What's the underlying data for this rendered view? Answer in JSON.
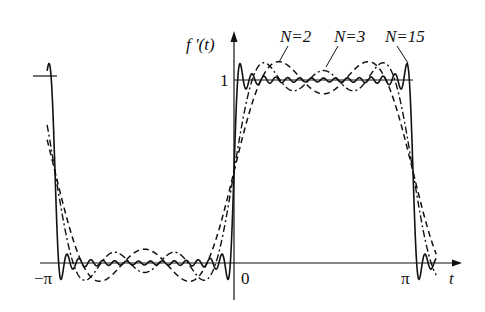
{
  "chart_data": {
    "type": "line",
    "title": "",
    "xlabel": "t",
    "ylabel": "f'(t)",
    "x_ticks": [
      "-π",
      "0",
      "π"
    ],
    "x_tick_values": [
      -3.14159,
      0,
      3.14159
    ],
    "y_ticks": [
      "1"
    ],
    "y_tick_values": [
      1
    ],
    "xlim": [
      -3.35,
      3.72
    ],
    "ylim": [
      -0.2,
      1.25
    ],
    "grid": false,
    "legend": "inline annotations",
    "target_function": {
      "low": 0,
      "high": 1,
      "period": 6.28319
    },
    "series": [
      {
        "name": "N=2",
        "label": "N=2",
        "style": "dashed",
        "harmonics": [
          1,
          3
        ]
      },
      {
        "name": "N=3",
        "label": "N=3",
        "style": "dash-dot",
        "harmonics": [
          1,
          3,
          5
        ]
      },
      {
        "name": "N=15",
        "label": "N=15",
        "style": "solid",
        "harmonics": [
          1,
          3,
          5,
          7,
          9,
          11,
          13,
          15,
          17,
          19,
          21,
          23,
          25,
          27,
          29
        ]
      }
    ],
    "annotations": [
      "N=2",
      "N=3",
      "N=15"
    ]
  },
  "labels": {
    "y_axis": "f '(t)",
    "x_axis": "t",
    "y_one": "1",
    "x_neg_pi": "−π",
    "x_zero": "0",
    "x_pi": "π",
    "n2": "N=2",
    "n3": "N=3",
    "n15": "N=15"
  }
}
